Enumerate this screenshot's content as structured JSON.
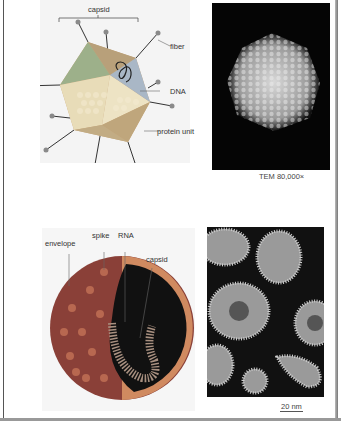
{
  "figure_top": {
    "illustration": {
      "title": "adenovirus model",
      "labels": {
        "capsid": "capsid",
        "fiber": "fiber",
        "dna": "DNA",
        "protein_unit": "protein unit"
      }
    },
    "micrograph": {
      "caption": "TEM 80,000×"
    }
  },
  "figure_bottom": {
    "illustration": {
      "title": "enveloped virus model",
      "labels": {
        "envelope": "envelope",
        "spike": "spike",
        "rna": "RNA",
        "capsid": "capsid"
      }
    },
    "micrograph": {
      "scale_bar": "20 nm"
    }
  },
  "colors": {
    "capsid_light": "#e6d9b8",
    "capsid_tan": "#c9a67a",
    "capsid_green": "#a8b890",
    "capsid_blue": "#a9b7c6",
    "fiber_knob": "#8a8a8a",
    "envelope_red": "#8a4038",
    "envelope_orange": "#d08a60",
    "interior": "#111111",
    "page_bg": "#ffffff"
  }
}
